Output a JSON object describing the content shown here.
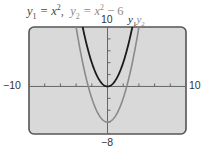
{
  "title": {
    "eq1": {
      "var": "y",
      "sub": "1",
      "rhs_var": "x",
      "rhs_sup": "2",
      "text": "y1 = x^2"
    },
    "separator": ",",
    "eq2": {
      "var": "y",
      "sub": "2",
      "rhs_var": "x",
      "rhs_sup": "2",
      "rhs_tail": " − 6",
      "text": "y2 = x^2 - 6"
    }
  },
  "axis_labels": {
    "ymax": "10",
    "ymin": "−8",
    "xmin": "−10",
    "xmax": "10"
  },
  "legend": {
    "y1": {
      "var": "y",
      "sub": "1"
    },
    "y2": {
      "var": "y",
      "sub": "2"
    }
  },
  "colors": {
    "screen_bg": "#d9d9d9",
    "screen_border": "#555555",
    "axis": "#666666",
    "y1_curve": "#1a1a1a",
    "y2_curve": "#8a8a8a"
  },
  "chart_data": {
    "type": "line",
    "xlabel": "",
    "ylabel": "",
    "xlim": [
      -10,
      10
    ],
    "ylim": [
      -8,
      10
    ],
    "xtick_step": 2,
    "ytick_step": 2,
    "grid": false,
    "legend_position": "top-right (above screen)",
    "x": [
      -4,
      -3.5,
      -3,
      -2.5,
      -2,
      -1.5,
      -1,
      -0.5,
      0,
      0.5,
      1,
      1.5,
      2,
      2.5,
      3,
      3.5,
      4
    ],
    "series": [
      {
        "name": "y1",
        "formula": "x^2",
        "color": "#1a1a1a",
        "values": [
          16,
          12.25,
          9,
          6.25,
          4,
          2.25,
          1,
          0.25,
          0,
          0.25,
          1,
          2.25,
          4,
          6.25,
          9,
          12.25,
          16
        ]
      },
      {
        "name": "y2",
        "formula": "x^2 - 6",
        "color": "#8a8a8a",
        "values": [
          10,
          6.25,
          3,
          0.25,
          -2,
          -3.75,
          -5,
          -5.75,
          -6,
          -5.75,
          -5,
          -3.75,
          -2,
          0.25,
          3,
          6.25,
          10
        ]
      }
    ]
  }
}
